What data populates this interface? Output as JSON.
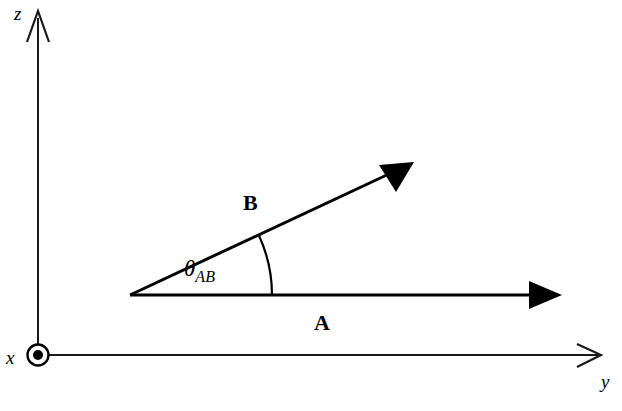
{
  "figure": {
    "type": "vector-diagram",
    "width": 622,
    "height": 411,
    "background_color": "#ffffff",
    "stroke_color": "#000000"
  },
  "axes": [
    {
      "id": "z",
      "label": "z",
      "direction": "up",
      "arrowhead": "open-thin",
      "origin": {
        "x": 38,
        "y": 355
      },
      "tip": {
        "x": 38,
        "y": 12
      }
    },
    {
      "id": "y",
      "label": "y",
      "direction": "right",
      "arrowhead": "open-thin",
      "origin": {
        "x": 38,
        "y": 355
      },
      "tip": {
        "x": 600,
        "y": 355
      }
    },
    {
      "id": "x",
      "label": "x",
      "direction": "out-of-page",
      "symbol": "circle-dot",
      "center": {
        "x": 38,
        "y": 355
      },
      "outer_radius": 11,
      "dot_radius": 5
    }
  ],
  "vectors": [
    {
      "id": "A",
      "label": "A",
      "arrowhead": "solid-filled",
      "tail": {
        "x": 130,
        "y": 295
      },
      "tip": {
        "x": 560,
        "y": 295
      },
      "angle_deg": 0,
      "label_position": {
        "x": 325,
        "y": 325
      }
    },
    {
      "id": "B",
      "label": "B",
      "arrowhead": "solid-filled",
      "tail": {
        "x": 130,
        "y": 295
      },
      "tip": {
        "x": 412,
        "y": 163
      },
      "angle_deg": 25,
      "label_position": {
        "x": 252,
        "y": 205
      }
    }
  ],
  "angle": {
    "symbol": "θ",
    "subscript": "AB",
    "full_label": "θAB",
    "between": [
      "A",
      "B"
    ],
    "vertex": {
      "x": 130,
      "y": 295
    },
    "arc_radius": 142,
    "start_deg": 0,
    "end_deg": 25,
    "label_position": {
      "x": 190,
      "y": 270
    }
  }
}
